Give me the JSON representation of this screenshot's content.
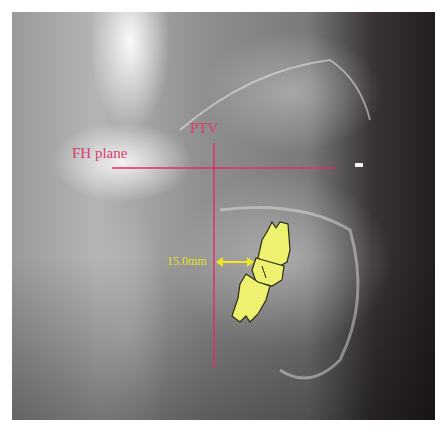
{
  "figure": {
    "type": "lateral cephalometric radiograph",
    "labels": {
      "fh_plane": "FH plane",
      "ptv": "PTV",
      "distance": "15.0mm"
    },
    "colors": {
      "reference_lines": "#e0306a",
      "measurement": "#f0e820",
      "tooth_fill": "#eef070",
      "tooth_outline": "#2a2a10"
    }
  }
}
